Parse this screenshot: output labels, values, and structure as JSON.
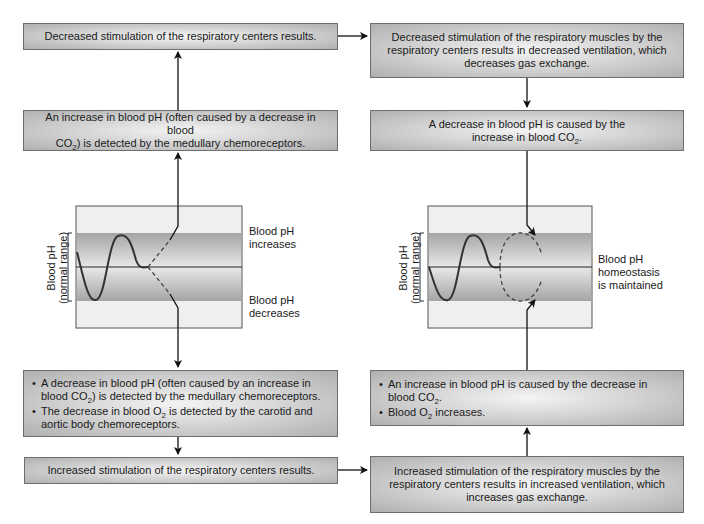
{
  "left_column": {
    "box1": {
      "text": "Decreased stimulation of the respiratory centers results."
    },
    "box2": {
      "line1": "An increase in blood pH (often caused by a decrease in blood",
      "line2_pre": "CO",
      "line2_sub": "2",
      "line2_post": ") is detected by the medullary chemoreceptors."
    },
    "diagram": {
      "axis_label_line1": "Blood pH",
      "axis_label_line2": "(normal range)",
      "label_top": "Blood pH increases",
      "label_bottom": "Blood pH decreases"
    },
    "box3": {
      "bullets": [
        {
          "pre": "A decrease in blood pH (often caused by an increase in blood CO",
          "sub": "2",
          "post": ") is detected by the medullary chemoreceptors."
        },
        {
          "pre": "The decrease in blood O",
          "sub": "2",
          "post": " is detected by the carotid and aortic body chemoreceptors."
        }
      ]
    },
    "box4": {
      "text": "Increased stimulation of the respiratory centers results."
    }
  },
  "right_column": {
    "box1": {
      "text": "Decreased stimulation of the respiratory muscles by the respiratory centers results in decreased ventilation, which decreases gas exchange."
    },
    "box2": {
      "pre": "A decrease in blood pH is caused by the increase in blood CO",
      "sub": "2",
      "post": "."
    },
    "diagram": {
      "axis_label_line1": "Blood pH",
      "axis_label_line2": "(normal range)",
      "label": "Blood pH homeostasis is maintained"
    },
    "box3": {
      "bullets": [
        {
          "pre": "An increase in blood pH is caused by the decrease in blood CO",
          "sub": "2",
          "post": "."
        },
        {
          "pre": "Blood O",
          "sub": "2",
          "post": " increases."
        }
      ]
    },
    "box4": {
      "text": "Increased stimulation of the respiratory muscles by the respiratory centers results in increased ventilation, which increases gas exchange."
    }
  },
  "colors": {
    "box_border": "#6e6e6e",
    "line": "#222222",
    "band_dark": "#a8a8a8",
    "band_light": "#ececec"
  }
}
